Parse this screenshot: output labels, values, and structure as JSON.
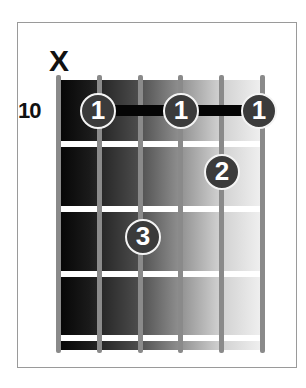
{
  "chord_diagram": {
    "type": "guitar-chord-chart",
    "starting_fret_label": "10",
    "string_markers": [
      {
        "string": 1,
        "marker": "X"
      }
    ],
    "strings_count": 6,
    "frets_shown": 4,
    "barre": {
      "finger": "1",
      "fret": 1,
      "from_string": 2,
      "to_string": 6
    },
    "fingers": [
      {
        "label": "1",
        "string": 2,
        "fret": 1
      },
      {
        "label": "1",
        "string": 4,
        "fret": 1
      },
      {
        "label": "1",
        "string": 6,
        "fret": 1
      },
      {
        "label": "2",
        "string": 5,
        "fret": 2
      },
      {
        "label": "3",
        "string": 3,
        "fret": 3
      }
    ],
    "colors": {
      "finger_fill": "#3b3b3b",
      "finger_ring": "#f4f4f4",
      "string": "#8a8a8a",
      "fret": "#ffffff",
      "gradient_start": "#050505",
      "gradient_end": "#f2f2f2"
    }
  }
}
